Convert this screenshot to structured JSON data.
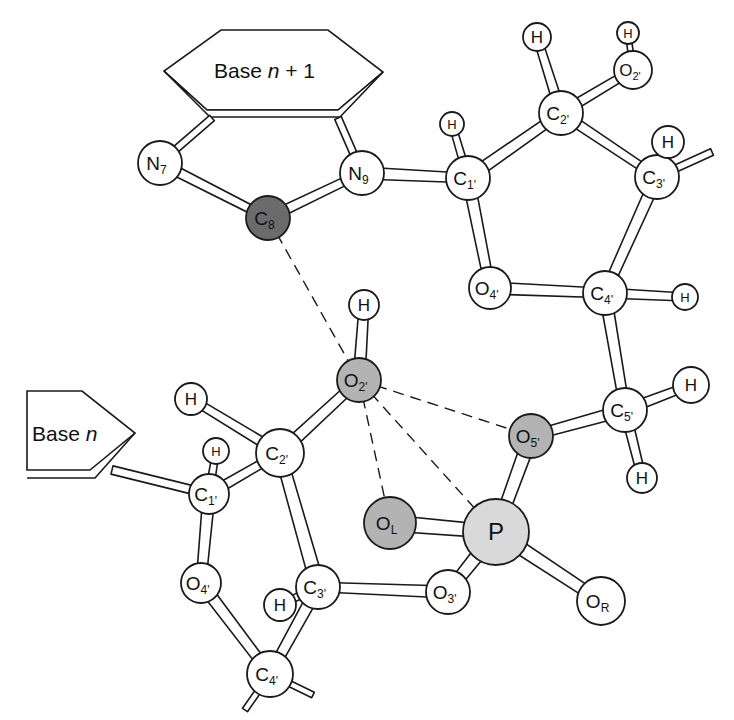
{
  "figure": {
    "colors": {
      "white": "#ffffff",
      "light_gray": "#d9d9d9",
      "mid_gray": "#b3b3b3",
      "dark_gray": "#6b6b6b",
      "line": "#1a1a1a"
    },
    "bases": [
      {
        "id": "base_n_plus_1",
        "label": "Base ",
        "italic": "n",
        "suffix": " + 1"
      },
      {
        "id": "base_n",
        "label": "Base ",
        "italic": "n",
        "suffix": ""
      }
    ],
    "atoms": [
      {
        "id": "N7",
        "el": "N",
        "sub": "7",
        "x": 160,
        "y": 163,
        "r": 22,
        "fill": "white"
      },
      {
        "id": "N9",
        "el": "N",
        "sub": "9",
        "x": 362,
        "y": 173,
        "r": 22,
        "fill": "white"
      },
      {
        "id": "C8",
        "el": "C",
        "sub": "8",
        "x": 268,
        "y": 218,
        "r": 22,
        "fill": "dark_gray",
        "text": "#ffffff"
      },
      {
        "id": "C1p_top",
        "el": "C",
        "sub": "1'",
        "x": 468,
        "y": 178,
        "r": 22,
        "fill": "white"
      },
      {
        "id": "H_C1p_top",
        "el": "H",
        "sub": "",
        "x": 452,
        "y": 124,
        "r": 12,
        "fill": "white"
      },
      {
        "id": "C2p_top",
        "el": "C",
        "sub": "2'",
        "x": 561,
        "y": 113,
        "r": 22,
        "fill": "white"
      },
      {
        "id": "H_C2p_top",
        "el": "H",
        "sub": "",
        "x": 537,
        "y": 37,
        "r": 14,
        "fill": "white"
      },
      {
        "id": "O2p_top",
        "el": "O",
        "sub": "2'",
        "x": 633,
        "y": 70,
        "r": 19,
        "fill": "white"
      },
      {
        "id": "H_O2p_top",
        "el": "H",
        "sub": "",
        "x": 628,
        "y": 33,
        "r": 11,
        "fill": "white"
      },
      {
        "id": "C3p_top",
        "el": "C",
        "sub": "3'",
        "x": 657,
        "y": 177,
        "r": 22,
        "fill": "white"
      },
      {
        "id": "H_C3p_top",
        "el": "H",
        "sub": "",
        "x": 668,
        "y": 142,
        "r": 16,
        "fill": "white"
      },
      {
        "id": "O4p_top",
        "el": "O",
        "sub": "4'",
        "x": 490,
        "y": 288,
        "r": 21,
        "fill": "white"
      },
      {
        "id": "C4p_top",
        "el": "C",
        "sub": "4'",
        "x": 605,
        "y": 293,
        "r": 22,
        "fill": "white"
      },
      {
        "id": "H_C4p_top",
        "el": "H",
        "sub": "",
        "x": 685,
        "y": 297,
        "r": 13,
        "fill": "white"
      },
      {
        "id": "C5p",
        "el": "C",
        "sub": "5'",
        "x": 625,
        "y": 410,
        "r": 22,
        "fill": "white"
      },
      {
        "id": "H_C5p_a",
        "el": "H",
        "sub": "",
        "x": 691,
        "y": 385,
        "r": 18,
        "fill": "white"
      },
      {
        "id": "H_C5p_b",
        "el": "H",
        "sub": "",
        "x": 642,
        "y": 478,
        "r": 15,
        "fill": "white"
      },
      {
        "id": "O5p",
        "el": "O",
        "sub": "5'",
        "x": 531,
        "y": 436,
        "r": 22,
        "fill": "mid_gray"
      },
      {
        "id": "O2p_low",
        "el": "O",
        "sub": "2'",
        "x": 359,
        "y": 380,
        "r": 22,
        "fill": "mid_gray"
      },
      {
        "id": "H_O2p_low",
        "el": "H",
        "sub": "",
        "x": 364,
        "y": 305,
        "r": 15,
        "fill": "white"
      },
      {
        "id": "OL",
        "el": "O",
        "sub": "L",
        "x": 390,
        "y": 523,
        "r": 26,
        "fill": "mid_gray",
        "subcase": "upper"
      },
      {
        "id": "P",
        "el": "P",
        "sub": "",
        "x": 496,
        "y": 532,
        "r": 33,
        "fill": "light_gray"
      },
      {
        "id": "O3p",
        "el": "O",
        "sub": "3'",
        "x": 448,
        "y": 592,
        "r": 22,
        "fill": "white"
      },
      {
        "id": "OR",
        "el": "O",
        "sub": "R",
        "x": 601,
        "y": 601,
        "r": 24,
        "fill": "white",
        "subcase": "upper"
      },
      {
        "id": "C2p_low",
        "el": "C",
        "sub": "2'",
        "x": 280,
        "y": 453,
        "r": 24,
        "fill": "white"
      },
      {
        "id": "H_C2p_low",
        "el": "H",
        "sub": "",
        "x": 191,
        "y": 399,
        "r": 16,
        "fill": "white"
      },
      {
        "id": "C1p_low",
        "el": "C",
        "sub": "1'",
        "x": 209,
        "y": 494,
        "r": 20,
        "fill": "white"
      },
      {
        "id": "H_C1p_low",
        "el": "H",
        "sub": "",
        "x": 216,
        "y": 451,
        "r": 13,
        "fill": "white"
      },
      {
        "id": "O4p_low",
        "el": "O",
        "sub": "4'",
        "x": 201,
        "y": 583,
        "r": 20,
        "fill": "white"
      },
      {
        "id": "C3p_low",
        "el": "C",
        "sub": "3'",
        "x": 318,
        "y": 587,
        "r": 22,
        "fill": "white"
      },
      {
        "id": "H_C3p_low",
        "el": "H",
        "sub": "",
        "x": 280,
        "y": 605,
        "r": 16,
        "fill": "white"
      },
      {
        "id": "C4p_low",
        "el": "C",
        "sub": "4'",
        "x": 270,
        "y": 674,
        "r": 23,
        "fill": "white"
      }
    ],
    "bonds": [
      [
        "N7",
        "C8",
        5
      ],
      [
        "C8",
        "N9",
        5
      ],
      [
        "N9",
        "C1p_top",
        6
      ],
      [
        "C1p_top",
        "H_C1p_top",
        4
      ],
      [
        "C1p_top",
        "C2p_top",
        6
      ],
      [
        "C1p_top",
        "O4p_top",
        6
      ],
      [
        "C2p_top",
        "H_C2p_top",
        5
      ],
      [
        "C2p_top",
        "O2p_top",
        5
      ],
      [
        "O2p_top",
        "H_O2p_top",
        3
      ],
      [
        "C2p_top",
        "C3p_top",
        5
      ],
      [
        "C3p_top",
        "H_C3p_top",
        4
      ],
      [
        "C3p_top",
        "C4p_top",
        6
      ],
      [
        "O4p_top",
        "C4p_top",
        6
      ],
      [
        "C4p_top",
        "H_C4p_top",
        5
      ],
      [
        "C4p_top",
        "C5p",
        6
      ],
      [
        "C5p",
        "H_C5p_a",
        5
      ],
      [
        "C5p",
        "H_C5p_b",
        5
      ],
      [
        "C5p",
        "O5p",
        6
      ],
      [
        "O5p",
        "P",
        7
      ],
      [
        "OL",
        "P",
        8
      ],
      [
        "P",
        "O3p",
        7
      ],
      [
        "P",
        "OR",
        7
      ],
      [
        "O3p",
        "C3p_low",
        6
      ],
      [
        "C3p_low",
        "H_C3p_low",
        4
      ],
      [
        "C3p_low",
        "C4p_low",
        6
      ],
      [
        "C3p_low",
        "C2p_low",
        7
      ],
      [
        "O4p_low",
        "C4p_low",
        6
      ],
      [
        "C1p_low",
        "O4p_low",
        6
      ],
      [
        "C1p_low",
        "C2p_low",
        5
      ],
      [
        "C1p_low",
        "H_C1p_low",
        4
      ],
      [
        "C2p_low",
        "H_C2p_low",
        5
      ],
      [
        "C2p_low",
        "O2p_low",
        6
      ],
      [
        "O2p_low",
        "H_O2p_low",
        6
      ]
    ],
    "stub_bonds": [
      {
        "from": "C3p_top",
        "x2": 712,
        "y2": 152,
        "w": 6
      },
      {
        "from": "C1p_low",
        "x2": 112,
        "y2": 470,
        "w": 7
      },
      {
        "from": "C4p_low",
        "x2": 245,
        "y2": 710,
        "w": 5
      },
      {
        "from": "C4p_low",
        "x2": 313,
        "y2": 695,
        "w": 5
      },
      {
        "from": "N7",
        "x2": 212,
        "y2": 118,
        "w": 6
      },
      {
        "from": "N9",
        "x2": 338,
        "y2": 118,
        "w": 6
      }
    ],
    "hbonds": [
      [
        "C8",
        "O2p_low"
      ],
      [
        "O2p_low",
        "O5p"
      ],
      [
        "O2p_low",
        "OL"
      ],
      [
        "O2p_low",
        "P"
      ]
    ]
  }
}
